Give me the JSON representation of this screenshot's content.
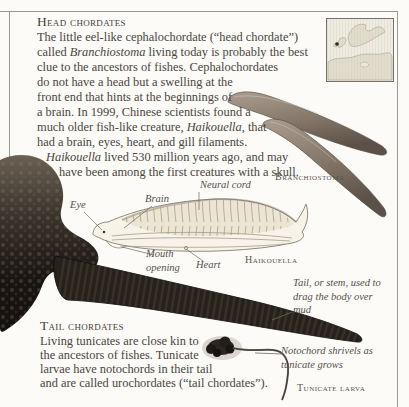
{
  "page": {
    "head_section": {
      "title": "Head chordates",
      "lines": [
        [
          "The little eel-like cephalochordate (“head chordate”)"
        ],
        [
          "called ",
          "Branchiostoma",
          " living today is probably the best"
        ],
        [
          "clue to the ancestors of fishes. Cephalochordates"
        ],
        [
          "do not have a head but a swelling at the"
        ],
        [
          "front end that hints at the beginnings of"
        ],
        [
          "a brain. In 1999, Chinese scientists found a"
        ],
        [
          "much older fish-like creature, ",
          "Haikouella",
          ", that"
        ],
        [
          "had a brain, eyes, heart, and gill filaments."
        ],
        [
          "Haikouella",
          " lived 530 million years ago, and may"
        ],
        [
          "have been among the first creatures with a skull."
        ]
      ]
    },
    "tail_section": {
      "title": "Tail chordates",
      "lines": [
        "Living tunicates are close kin to",
        "the ancestors of fishes. Tunicate",
        "larvae have notochords in their tail",
        "and are called urochordates (“tail chordates”)."
      ]
    },
    "specimen_labels": {
      "branchiostoma": "Branchiostoma",
      "haikouella": "Haikouella",
      "tunicate_larva": "Tunicate larva"
    },
    "diagram_labels": {
      "neural_cord": "Neural cord",
      "brain": "Brain",
      "eye": "Eye",
      "mouth_opening": "Mouth opening",
      "heart": "Heart"
    },
    "annotations": {
      "tail_stem": "Tail, or stem, used to drag the body over mud",
      "notochord": "Notochord shrivels as tunicate grows"
    },
    "colors": {
      "page_bg": "#fcfbf8",
      "ink": "#4a453d",
      "rule": "#9b9791",
      "map_land": "#e1dccb",
      "lancelet": "#8a7d70",
      "tunicate_dark": "#1c1814"
    }
  }
}
